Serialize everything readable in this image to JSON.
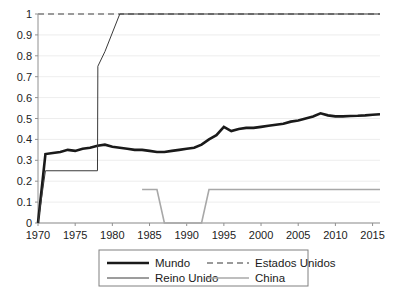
{
  "chart_data": {
    "type": "line",
    "title": "",
    "xlabel": "",
    "ylabel": "",
    "xlim": [
      1970,
      2016
    ],
    "ylim": [
      0,
      1
    ],
    "grid": true,
    "legend_position": "bottom",
    "y_ticks": [
      "0",
      "0.1",
      "0.2",
      "0.3",
      "0.4",
      "0.5",
      "0.6",
      "0.7",
      "0.8",
      "0.9",
      "1"
    ],
    "y_tick_values": [
      0,
      0.1,
      0.2,
      0.3,
      0.4,
      0.5,
      0.6,
      0.7,
      0.8,
      0.9,
      1
    ],
    "x_ticks": [
      "1970",
      "1975",
      "1980",
      "1985",
      "1990",
      "1995",
      "2000",
      "2005",
      "2010",
      "2015"
    ],
    "x_tick_values": [
      1970,
      1975,
      1980,
      1985,
      1990,
      1995,
      2000,
      2005,
      2010,
      2015
    ],
    "series": [
      {
        "name": "Mundo",
        "color": "#1a1a1a",
        "width": 2.6,
        "dash": "none",
        "x": [
          1970,
          1971,
          1972,
          1973,
          1974,
          1975,
          1976,
          1977,
          1978,
          1979,
          1980,
          1981,
          1982,
          1983,
          1984,
          1985,
          1986,
          1987,
          1988,
          1989,
          1990,
          1991,
          1992,
          1993,
          1994,
          1995,
          1996,
          1997,
          1998,
          1999,
          2000,
          2001,
          2002,
          2003,
          2004,
          2005,
          2006,
          2007,
          2008,
          2009,
          2010,
          2011,
          2012,
          2013,
          2014,
          2015,
          2016
        ],
        "y": [
          0.0,
          0.33,
          0.335,
          0.34,
          0.35,
          0.345,
          0.355,
          0.36,
          0.37,
          0.375,
          0.365,
          0.36,
          0.355,
          0.35,
          0.35,
          0.345,
          0.34,
          0.34,
          0.345,
          0.35,
          0.355,
          0.36,
          0.375,
          0.4,
          0.42,
          0.46,
          0.44,
          0.45,
          0.455,
          0.455,
          0.46,
          0.465,
          0.47,
          0.475,
          0.485,
          0.49,
          0.5,
          0.51,
          0.525,
          0.515,
          0.51,
          0.51,
          0.512,
          0.513,
          0.515,
          0.518,
          0.52
        ]
      },
      {
        "name": "Estados Unidos",
        "color": "#9a9a9a",
        "width": 2.0,
        "dash": "6,4",
        "x": [
          1970,
          1975,
          1980,
          1985,
          1990,
          1995,
          2000,
          2005,
          2010,
          2016
        ],
        "y": [
          1.0,
          1.0,
          1.0,
          1.0,
          1.0,
          1.0,
          1.0,
          1.0,
          1.0,
          1.0
        ]
      },
      {
        "name": "Reino Unido",
        "color": "#3a3a3a",
        "width": 1.0,
        "dash": "none",
        "x": [
          1970,
          1971,
          1978,
          1978.05,
          1979,
          1981,
          1990,
          2000,
          2010,
          2016
        ],
        "y": [
          0.0,
          0.25,
          0.25,
          0.75,
          0.82,
          1.0,
          1.0,
          1.0,
          1.0,
          1.0
        ]
      },
      {
        "name": "China",
        "color": "#a8a8a8",
        "width": 1.6,
        "dash": "none",
        "x": [
          1984,
          1986,
          1987,
          1992,
          1993,
          2000,
          2010,
          2016
        ],
        "y": [
          0.16,
          0.16,
          0.0,
          0.0,
          0.16,
          0.16,
          0.16,
          0.16
        ]
      }
    ]
  },
  "legend": {
    "entries": [
      {
        "label": "Mundo",
        "color": "#1a1a1a",
        "width": 2.6,
        "dash": "none"
      },
      {
        "label": "Estados Unidos",
        "color": "#9a9a9a",
        "width": 2.0,
        "dash": "6,4"
      },
      {
        "label": "Reino Unido",
        "color": "#3a3a3a",
        "width": 1.0,
        "dash": "none"
      },
      {
        "label": "China",
        "color": "#a8a8a8",
        "width": 1.6,
        "dash": "none"
      }
    ]
  }
}
